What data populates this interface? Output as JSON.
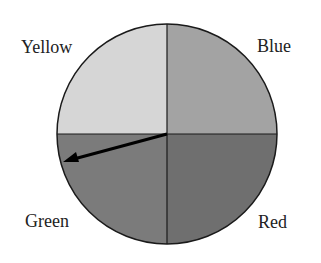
{
  "spinner": {
    "center": [
      167,
      134
    ],
    "radius": 110,
    "sections": [
      {
        "label": "Yellow",
        "color": "#d6d6d6",
        "quadrant": "top-left"
      },
      {
        "label": "Blue",
        "color": "#a3a3a3",
        "quadrant": "top-right"
      },
      {
        "label": "Green",
        "color": "#7b7b7b",
        "quadrant": "bottom-left"
      },
      {
        "label": "Red",
        "color": "#6f6f6f",
        "quadrant": "bottom-right"
      }
    ],
    "arrow": {
      "from": [
        167,
        134
      ],
      "to": [
        63,
        162
      ],
      "points_to": "Green"
    }
  }
}
